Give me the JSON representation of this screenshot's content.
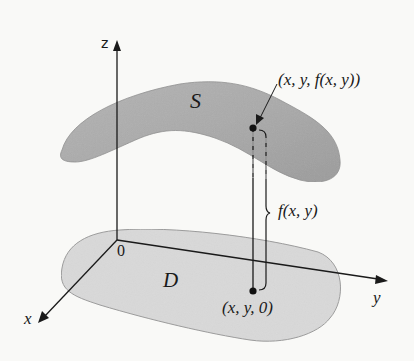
{
  "figure": {
    "type": "3D surface over planar region",
    "colors": {
      "background": "#f9f9f7",
      "surface_fill": "#a9a9a9",
      "surface_edge": "#8e8e8e",
      "region_fill": "#d9d9d9",
      "region_edge": "#9a9a9a",
      "ink": "#1a1a1a"
    },
    "axes": {
      "z_label": "z",
      "y_label": "y",
      "x_label": "x",
      "origin_label": "0"
    },
    "surface": {
      "label": "S"
    },
    "region": {
      "label": "D"
    },
    "points": {
      "top_label": "(x, y, f(x, y))",
      "bottom_label": "(x, y, 0)"
    },
    "height_brace": {
      "label": "f(x, y)"
    }
  }
}
